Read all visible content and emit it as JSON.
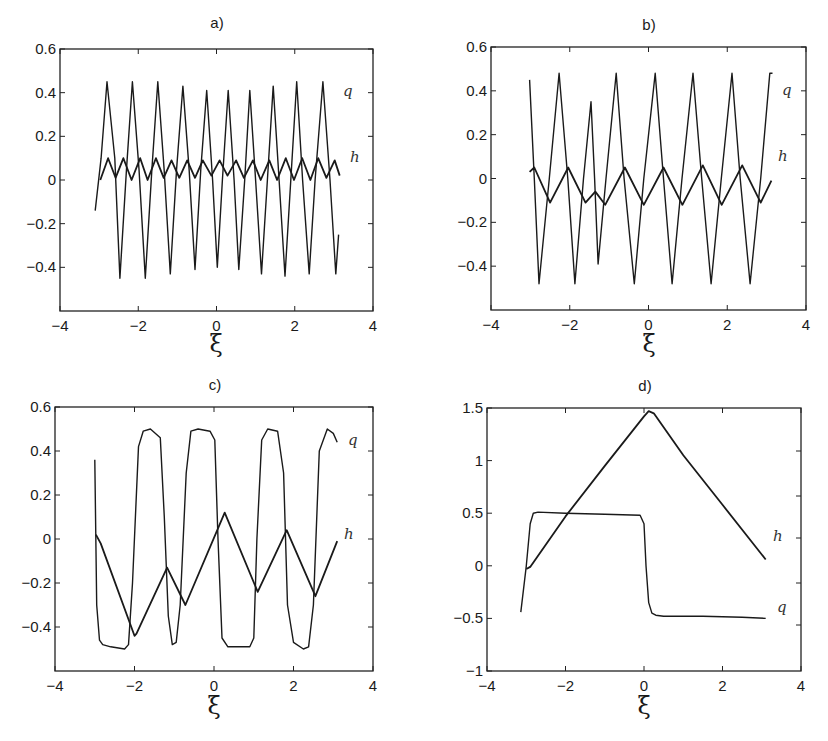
{
  "figure": {
    "panels": [
      {
        "id": "a",
        "title": "a)",
        "xlabel": "ξ",
        "series_labels": {
          "q": "q",
          "h": "h"
        }
      },
      {
        "id": "b",
        "title": "b)",
        "xlabel": "ξ",
        "series_labels": {
          "q": "q",
          "h": "h"
        }
      },
      {
        "id": "c",
        "title": "c)",
        "xlabel": "ξ",
        "series_labels": {
          "q": "q",
          "h": "h"
        }
      },
      {
        "id": "d",
        "title": "d)",
        "xlabel": "ξ",
        "series_labels": {
          "q": "q",
          "h": "h"
        }
      }
    ]
  },
  "chart_data": [
    {
      "type": "line",
      "title": "a)",
      "xlabel": "ξ",
      "ylabel": "",
      "xlim": [
        -4,
        4
      ],
      "ylim": [
        -0.6,
        0.6
      ],
      "xticks": [
        -4,
        -2,
        0,
        2,
        4
      ],
      "yticks": [
        0.6,
        0.4,
        0.2,
        0,
        -0.2,
        -0.4
      ],
      "ytick_labels": [
        "0.6",
        "0.4",
        "0.2",
        "0",
        "−0.2",
        "−0.4"
      ],
      "xtick_labels": [
        "−4",
        "−2",
        "0",
        "2",
        "4"
      ],
      "grid": false,
      "legend": "inline labels at right end of curves",
      "series": [
        {
          "name": "q",
          "x": [
            -3.1,
            -2.95,
            -2.8,
            -2.6,
            -2.47,
            -2.3,
            -2.15,
            -1.98,
            -1.82,
            -1.65,
            -1.5,
            -1.34,
            -1.18,
            -1.02,
            -0.86,
            -0.7,
            -0.55,
            -0.4,
            -0.25,
            -0.1,
            0.02,
            0.15,
            0.3,
            0.45,
            0.57,
            0.72,
            0.85,
            1.0,
            1.15,
            1.3,
            1.45,
            1.6,
            1.75,
            1.9,
            2.05,
            2.2,
            2.37,
            2.52,
            2.72,
            2.9,
            3.05,
            3.12
          ],
          "y": [
            -0.14,
            0.1,
            0.45,
            0.1,
            -0.45,
            0.05,
            0.45,
            0.05,
            -0.45,
            0.05,
            0.45,
            0.05,
            -0.43,
            0.05,
            0.43,
            0.05,
            -0.41,
            0.05,
            0.41,
            0.0,
            -0.4,
            0.0,
            0.41,
            0.0,
            -0.41,
            0.0,
            0.41,
            0.0,
            -0.43,
            0.0,
            0.43,
            0.0,
            -0.44,
            0.0,
            0.45,
            0.0,
            -0.43,
            0.0,
            0.45,
            0.0,
            -0.43,
            -0.25
          ]
        },
        {
          "name": "h",
          "x": [
            -2.97,
            -2.77,
            -2.58,
            -2.38,
            -2.17,
            -1.95,
            -1.76,
            -1.55,
            -1.35,
            -1.15,
            -0.95,
            -0.75,
            -0.55,
            -0.35,
            -0.13,
            0.08,
            0.28,
            0.5,
            0.7,
            0.93,
            1.13,
            1.35,
            1.55,
            1.77,
            1.98,
            2.19,
            2.4,
            2.6,
            2.81,
            3.02,
            3.15
          ],
          "y": [
            0.0,
            0.1,
            0.01,
            0.1,
            0.0,
            0.1,
            0.0,
            0.1,
            0.01,
            0.09,
            0.01,
            0.09,
            0.01,
            0.09,
            0.02,
            0.09,
            0.02,
            0.09,
            0.01,
            0.09,
            0.0,
            0.09,
            0.0,
            0.1,
            0.0,
            0.1,
            0.0,
            0.1,
            0.01,
            0.09,
            0.02
          ]
        }
      ]
    },
    {
      "type": "line",
      "title": "b)",
      "xlabel": "ξ",
      "ylabel": "",
      "xlim": [
        -4,
        4
      ],
      "ylim": [
        -0.6,
        0.6
      ],
      "xticks": [
        -4,
        -2,
        0,
        2,
        4
      ],
      "yticks": [
        0.6,
        0.4,
        0.2,
        0,
        -0.2,
        -0.4
      ],
      "ytick_labels": [
        "0.6",
        "0.4",
        "0.2",
        "0",
        "−0.2",
        "−0.4"
      ],
      "xtick_labels": [
        "−4",
        "−2",
        "0",
        "2",
        "4"
      ],
      "grid": false,
      "legend": "inline labels at right end of curves",
      "series": [
        {
          "name": "q",
          "x": [
            -3.02,
            -2.9,
            -2.78,
            -2.52,
            -2.27,
            -2.05,
            -1.87,
            -1.65,
            -1.46,
            -1.37,
            -1.28,
            -1.08,
            -0.82,
            -0.62,
            -0.36,
            -0.12,
            0.17,
            0.38,
            0.6,
            0.85,
            1.13,
            1.35,
            1.59,
            1.85,
            2.12,
            2.33,
            2.58,
            2.85,
            3.08,
            3.15
          ],
          "y": [
            0.45,
            0.0,
            -0.48,
            0.0,
            0.48,
            0.0,
            -0.48,
            0.0,
            0.35,
            0.0,
            -0.39,
            0.0,
            0.48,
            0.0,
            -0.48,
            0.0,
            0.48,
            0.0,
            -0.48,
            0.0,
            0.48,
            0.0,
            -0.48,
            0.0,
            0.48,
            0.0,
            -0.48,
            0.0,
            0.48,
            0.48
          ]
        },
        {
          "name": "h",
          "x": [
            -3.02,
            -2.9,
            -2.5,
            -2.04,
            -1.6,
            -1.35,
            -1.1,
            -0.6,
            -0.12,
            0.38,
            0.86,
            1.38,
            1.86,
            2.38,
            2.85,
            3.12
          ],
          "y": [
            0.03,
            0.05,
            -0.11,
            0.05,
            -0.11,
            -0.06,
            -0.12,
            0.05,
            -0.12,
            0.05,
            -0.12,
            0.06,
            -0.12,
            0.06,
            -0.11,
            -0.01
          ]
        }
      ]
    },
    {
      "type": "line",
      "title": "c)",
      "xlabel": "ξ",
      "ylabel": "",
      "xlim": [
        -4,
        4
      ],
      "ylim": [
        -0.6,
        0.6
      ],
      "xticks": [
        -4,
        -2,
        0,
        2,
        4
      ],
      "yticks": [
        0.6,
        0.4,
        0.2,
        0,
        -0.2,
        -0.4
      ],
      "ytick_labels": [
        "0.6",
        "0.4",
        "0.2",
        "0",
        "−0.2",
        "−0.4"
      ],
      "xtick_labels": [
        "−4",
        "−2",
        "0",
        "2",
        "4"
      ],
      "grid": false,
      "legend": "inline labels at right end of curves",
      "series": [
        {
          "name": "q",
          "x": [
            -3.0,
            -2.95,
            -2.88,
            -2.8,
            -2.6,
            -2.25,
            -2.15,
            -2.05,
            -1.9,
            -1.78,
            -1.6,
            -1.35,
            -1.25,
            -1.15,
            -1.05,
            -0.95,
            -0.85,
            -0.7,
            -0.58,
            -0.4,
            -0.1,
            0.02,
            0.1,
            0.2,
            0.35,
            0.55,
            0.9,
            1.0,
            1.08,
            1.2,
            1.35,
            1.6,
            1.75,
            1.85,
            2.0,
            2.25,
            2.38,
            2.5,
            2.65,
            2.85,
            3.0,
            3.1
          ],
          "y": [
            0.36,
            -0.3,
            -0.46,
            -0.48,
            -0.49,
            -0.5,
            -0.48,
            -0.2,
            0.42,
            0.49,
            0.5,
            0.46,
            0.1,
            -0.35,
            -0.48,
            -0.47,
            -0.3,
            0.3,
            0.49,
            0.5,
            0.49,
            0.45,
            0.0,
            -0.45,
            -0.49,
            -0.49,
            -0.49,
            -0.45,
            0.0,
            0.45,
            0.5,
            0.49,
            0.3,
            -0.3,
            -0.47,
            -0.5,
            -0.49,
            -0.3,
            0.4,
            0.5,
            0.48,
            0.44
          ]
        },
        {
          "name": "h",
          "x": [
            -2.97,
            -2.85,
            -2.0,
            -1.95,
            -1.18,
            -0.72,
            0.27,
            1.1,
            1.83,
            2.55,
            3.1
          ],
          "y": [
            0.02,
            -0.02,
            -0.44,
            -0.43,
            -0.13,
            -0.3,
            0.12,
            -0.24,
            0.04,
            -0.26,
            -0.01
          ]
        }
      ]
    },
    {
      "type": "line",
      "title": "d)",
      "xlabel": "ξ",
      "ylabel": "",
      "xlim": [
        -4,
        4
      ],
      "ylim": [
        -1,
        1.5
      ],
      "xticks": [
        -4,
        -2,
        0,
        2,
        4
      ],
      "yticks": [
        1.5,
        1,
        0.5,
        0,
        -0.5,
        -1
      ],
      "ytick_labels": [
        "1.5",
        "1",
        "0.5",
        "0",
        "−0.5",
        "−1"
      ],
      "xtick_labels": [
        "−4",
        "−2",
        "0",
        "2",
        "4"
      ],
      "right_ticks_px": [
        451,
        496,
        538,
        583,
        625
      ],
      "grid": false,
      "legend": "inline labels at right end of curves",
      "series": [
        {
          "name": "q",
          "x": [
            -3.14,
            -3.0,
            -2.9,
            -2.82,
            -2.7,
            -2.0,
            -1.0,
            -0.1,
            0.0,
            0.05,
            0.12,
            0.2,
            0.3,
            0.5,
            1.5,
            2.5,
            3.1
          ],
          "y": [
            -0.44,
            0.0,
            0.4,
            0.5,
            0.51,
            0.5,
            0.49,
            0.48,
            0.4,
            0.0,
            -0.35,
            -0.45,
            -0.47,
            -0.48,
            -0.48,
            -0.49,
            -0.5
          ]
        },
        {
          "name": "h",
          "x": [
            -3.0,
            -2.9,
            -2.0,
            -1.0,
            0.0,
            0.12,
            0.25,
            1.0,
            2.0,
            3.1
          ],
          "y": [
            -0.03,
            -0.01,
            0.47,
            0.95,
            1.42,
            1.47,
            1.45,
            1.05,
            0.58,
            0.06
          ]
        }
      ]
    }
  ]
}
